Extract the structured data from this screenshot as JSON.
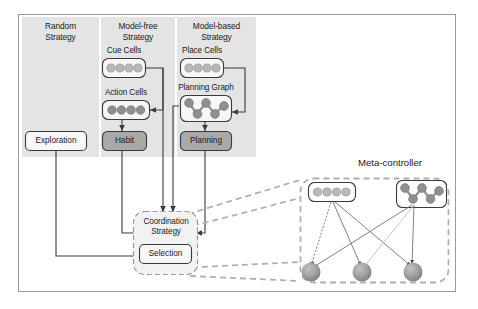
{
  "figure": {
    "title_meta": "Meta-controller",
    "frame_color": "#9a9a9a",
    "panel_fill": "#e4e4e4",
    "dark_button_fill": "#a9a9a9",
    "light_box_fill": "#f2f2f2",
    "cue_cell_fill": "#b8b8b8",
    "action_cell_fill": "#8f8f8f",
    "graph_node_fill": "#8f8f8f",
    "output_node_fill": "#9e9e9e",
    "arrow_color": "#3a3a3a",
    "dashed_color": "#b0b0b0"
  },
  "columns": [
    {
      "id": "random",
      "title": "Random\nStrategy"
    },
    {
      "id": "model_free",
      "title": "Model-free\nStrategy"
    },
    {
      "id": "model_based",
      "title": "Model-based\nStrategy"
    }
  ],
  "random_strategy": {
    "exploration_label": "Exploration"
  },
  "model_free": {
    "cue_cells_label": "Cue Cells",
    "cue_cells_count": 4,
    "action_cells_label": "Action Cells",
    "action_cells_count": 4,
    "habit_label": "Habit"
  },
  "model_based": {
    "place_cells_label": "Place Cells",
    "place_cells_count": 4,
    "planning_graph_label": "Planning Graph",
    "planning_graph_nodes": 5,
    "planning_label": "Planning"
  },
  "coordination": {
    "title": "Coordination\nStrategy",
    "selection_label": "Selection"
  },
  "meta_controller": {
    "title": "Meta-controller",
    "input_cells_count": 4,
    "graph_nodes_count": 5,
    "output_nodes_count": 3
  }
}
